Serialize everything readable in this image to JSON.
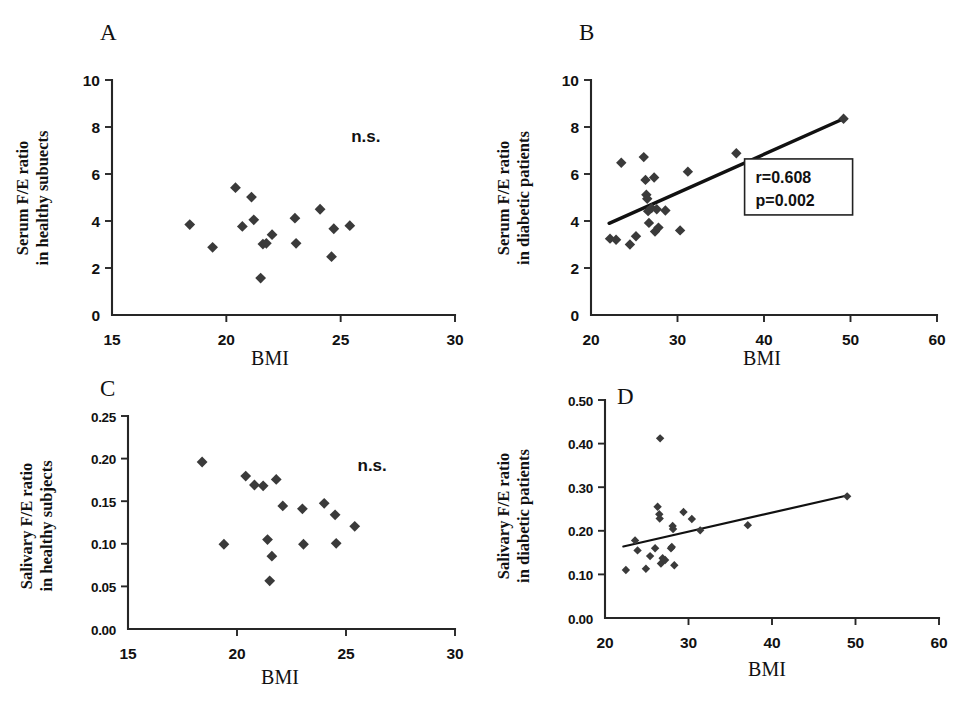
{
  "figure": {
    "background": "#ffffff",
    "marker_color": "#3a3a3a",
    "axis_color": "#262626",
    "panels": [
      "A",
      "B",
      "C",
      "D"
    ]
  },
  "chart_data": [
    {
      "id": "A",
      "type": "scatter",
      "panel_letter": "A",
      "title": "",
      "xlabel": "BMI",
      "ylabel_line1": "Serum F/E ratio",
      "ylabel_line2": "in healthy subuects",
      "xlim": [
        15,
        30
      ],
      "ylim": [
        0,
        10
      ],
      "xticks": [
        15,
        20,
        25,
        30
      ],
      "yticks": [
        0,
        2,
        4,
        6,
        8,
        10
      ],
      "xticklabels": [
        "15",
        "20",
        "25",
        "30"
      ],
      "yticklabels": [
        "0",
        "2",
        "4",
        "6",
        "8",
        "10"
      ],
      "grid": false,
      "annotation": "n.s.",
      "annotation_x": 26.1,
      "annotation_y": 7.35,
      "fit_line": null,
      "points": [
        {
          "x": 18.4,
          "y": 3.85
        },
        {
          "x": 19.4,
          "y": 2.88
        },
        {
          "x": 20.4,
          "y": 5.42
        },
        {
          "x": 20.7,
          "y": 3.77
        },
        {
          "x": 21.1,
          "y": 5.02
        },
        {
          "x": 21.2,
          "y": 4.05
        },
        {
          "x": 21.5,
          "y": 1.57
        },
        {
          "x": 21.6,
          "y": 3.02
        },
        {
          "x": 21.75,
          "y": 3.05
        },
        {
          "x": 22.0,
          "y": 3.42
        },
        {
          "x": 23.0,
          "y": 4.12
        },
        {
          "x": 23.05,
          "y": 3.05
        },
        {
          "x": 24.1,
          "y": 4.5
        },
        {
          "x": 24.6,
          "y": 2.48
        },
        {
          "x": 24.7,
          "y": 3.67
        },
        {
          "x": 25.4,
          "y": 3.8
        }
      ]
    },
    {
      "id": "B",
      "type": "scatter",
      "panel_letter": "B",
      "title": "",
      "xlabel": "BMI",
      "ylabel_line1": "Serum F/E ratio",
      "ylabel_line2": "in diabetic patients",
      "xlim": [
        20,
        60
      ],
      "ylim": [
        0,
        10
      ],
      "xticks": [
        20,
        30,
        40,
        50,
        60
      ],
      "yticks": [
        0,
        2,
        4,
        6,
        8,
        10
      ],
      "xticklabels": [
        "20",
        "30",
        "40",
        "50",
        "60"
      ],
      "yticklabels": [
        "0",
        "2",
        "4",
        "6",
        "8",
        "10"
      ],
      "grid": false,
      "annotation": null,
      "stats": {
        "r": "r=0.608",
        "p": "p=0.002"
      },
      "stats_box_x": 44.0,
      "stats_box_y": 5.45,
      "fit_line": {
        "x1": 22.1,
        "y1": 3.9,
        "x2": 49.2,
        "y2": 8.35,
        "width": 3.4
      },
      "points": [
        {
          "x": 22.2,
          "y": 3.25
        },
        {
          "x": 22.9,
          "y": 3.2
        },
        {
          "x": 23.5,
          "y": 6.48
        },
        {
          "x": 24.5,
          "y": 3.0
        },
        {
          "x": 25.2,
          "y": 3.35
        },
        {
          "x": 26.1,
          "y": 6.72
        },
        {
          "x": 26.3,
          "y": 5.75
        },
        {
          "x": 26.4,
          "y": 5.12
        },
        {
          "x": 26.5,
          "y": 4.95
        },
        {
          "x": 26.6,
          "y": 4.42
        },
        {
          "x": 26.7,
          "y": 3.92
        },
        {
          "x": 27.0,
          "y": 4.55
        },
        {
          "x": 27.3,
          "y": 5.85
        },
        {
          "x": 27.4,
          "y": 3.55
        },
        {
          "x": 27.6,
          "y": 4.5
        },
        {
          "x": 27.8,
          "y": 3.72
        },
        {
          "x": 28.6,
          "y": 4.45
        },
        {
          "x": 30.3,
          "y": 3.6
        },
        {
          "x": 31.2,
          "y": 6.1
        },
        {
          "x": 36.8,
          "y": 6.88
        },
        {
          "x": 49.2,
          "y": 8.35
        }
      ]
    },
    {
      "id": "C",
      "type": "scatter",
      "panel_letter": "C",
      "title": "",
      "xlabel": "BMI",
      "ylabel_line1": "Salivary F/E ratio",
      "ylabel_line2": "in healthy subjects",
      "xlim": [
        15,
        30
      ],
      "ylim": [
        0,
        0.25
      ],
      "xticks": [
        15,
        20,
        25,
        30
      ],
      "yticks": [
        0,
        0.05,
        0.1,
        0.15,
        0.2,
        0.25
      ],
      "xticklabels": [
        "15",
        "20",
        "25",
        "30"
      ],
      "yticklabels": [
        "0.00",
        "0.05",
        "0.10",
        "0.15",
        "0.20",
        "0.25"
      ],
      "grid": false,
      "annotation": "n.s.",
      "annotation_x": 26.2,
      "annotation_y": 0.185,
      "fit_line": null,
      "points": [
        {
          "x": 18.4,
          "y": 0.196
        },
        {
          "x": 19.4,
          "y": 0.0995
        },
        {
          "x": 20.4,
          "y": 0.1795
        },
        {
          "x": 20.8,
          "y": 0.169
        },
        {
          "x": 21.2,
          "y": 0.168
        },
        {
          "x": 21.4,
          "y": 0.105
        },
        {
          "x": 21.5,
          "y": 0.0565
        },
        {
          "x": 21.6,
          "y": 0.0855
        },
        {
          "x": 21.8,
          "y": 0.1755
        },
        {
          "x": 22.1,
          "y": 0.1445
        },
        {
          "x": 23.0,
          "y": 0.141
        },
        {
          "x": 23.05,
          "y": 0.0995
        },
        {
          "x": 24.0,
          "y": 0.1475
        },
        {
          "x": 24.5,
          "y": 0.134
        },
        {
          "x": 24.55,
          "y": 0.1005
        },
        {
          "x": 25.4,
          "y": 0.1205
        }
      ]
    },
    {
      "id": "D",
      "type": "scatter",
      "panel_letter": "D",
      "title": "",
      "xlabel": "BMI",
      "ylabel_line1": "Salivary F/E ratio",
      "ylabel_line2": "in diabetic patients",
      "xlim": [
        20,
        60
      ],
      "ylim": [
        0,
        0.5
      ],
      "xticks": [
        20,
        30,
        40,
        50,
        60
      ],
      "yticks": [
        0,
        0.1,
        0.2,
        0.3,
        0.4,
        0.5
      ],
      "xticklabels": [
        "20",
        "30",
        "40",
        "50",
        "60"
      ],
      "yticklabels": [
        "0.00",
        "0.10",
        "0.20",
        "0.30",
        "0.40",
        "0.50"
      ],
      "grid": false,
      "annotation": null,
      "fit_line": {
        "x1": 22.2,
        "y1": 0.164,
        "x2": 49.0,
        "y2": 0.281,
        "width": 2.2
      },
      "points": [
        {
          "x": 22.5,
          "y": 0.11
        },
        {
          "x": 23.6,
          "y": 0.178
        },
        {
          "x": 23.9,
          "y": 0.155
        },
        {
          "x": 24.9,
          "y": 0.113
        },
        {
          "x": 25.4,
          "y": 0.142
        },
        {
          "x": 26.0,
          "y": 0.16
        },
        {
          "x": 26.3,
          "y": 0.255
        },
        {
          "x": 26.5,
          "y": 0.238
        },
        {
          "x": 26.55,
          "y": 0.228
        },
        {
          "x": 26.6,
          "y": 0.412
        },
        {
          "x": 26.7,
          "y": 0.125
        },
        {
          "x": 26.9,
          "y": 0.137
        },
        {
          "x": 27.2,
          "y": 0.133
        },
        {
          "x": 27.9,
          "y": 0.16
        },
        {
          "x": 28.0,
          "y": 0.163
        },
        {
          "x": 28.1,
          "y": 0.211
        },
        {
          "x": 28.15,
          "y": 0.204
        },
        {
          "x": 28.3,
          "y": 0.121
        },
        {
          "x": 29.4,
          "y": 0.243
        },
        {
          "x": 30.4,
          "y": 0.227
        },
        {
          "x": 31.4,
          "y": 0.201
        },
        {
          "x": 37.1,
          "y": 0.213
        },
        {
          "x": 49.0,
          "y": 0.279
        }
      ]
    }
  ]
}
